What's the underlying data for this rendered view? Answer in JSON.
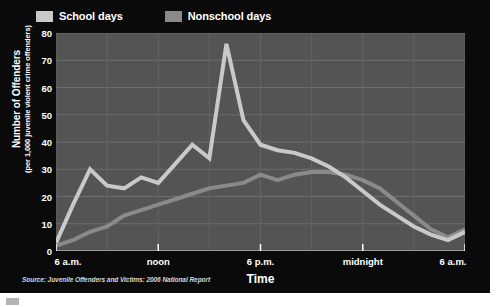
{
  "legend": {
    "items": [
      {
        "label": "School days",
        "color": "#c9c9c9",
        "name": "school-days"
      },
      {
        "label": "Nonschool days",
        "color": "#8a8a8a",
        "name": "nonschool-days"
      }
    ]
  },
  "axes": {
    "y_title_main": "Number of Offenders",
    "y_title_sub": "(per 1,000 juvenile violent crime offenders)",
    "x_title": "Time"
  },
  "source": "Source: Juvenile Offenders and Victims: 2006 National Report",
  "chart_data": {
    "type": "line",
    "title": "",
    "xlabel": "Time",
    "ylabel": "Number of Offenders",
    "ylabel_sub": "(per 1,000 juvenile violent crime offenders)",
    "ylim": [
      0,
      80
    ],
    "yticks": [
      0,
      10,
      20,
      30,
      40,
      50,
      60,
      70,
      80
    ],
    "grid": true,
    "legend_position": "top-left",
    "plot_bg": "#545454",
    "panel_bg": "#0a0a0a",
    "x": [
      6,
      7,
      8,
      9,
      10,
      11,
      12,
      13,
      14,
      15,
      16,
      17,
      18,
      19,
      20,
      21,
      22,
      23,
      24,
      25,
      26,
      27,
      28,
      29,
      30
    ],
    "xticks": [
      {
        "value": 6,
        "label": "6 a.m."
      },
      {
        "value": 12,
        "label": "noon"
      },
      {
        "value": 18,
        "label": "6 p.m."
      },
      {
        "value": 24,
        "label": "midnight"
      },
      {
        "value": 30,
        "label": "6 a.m."
      }
    ],
    "xtick_hours": [
      "6 a.m.",
      "noon",
      "6 p.m.",
      "midnight",
      "6 a.m."
    ],
    "series": [
      {
        "name": "School days",
        "color": "#c9c9c9",
        "values": [
          3,
          17,
          30,
          24,
          23,
          27,
          25,
          32,
          39,
          34,
          76,
          48,
          39,
          37,
          36,
          34,
          31,
          27,
          22,
          17,
          13,
          9,
          6,
          4,
          7
        ]
      },
      {
        "name": "Nonschool days",
        "color": "#8a8a8a",
        "values": [
          2,
          4,
          7,
          9,
          13,
          15,
          17,
          19,
          21,
          23,
          24,
          25,
          28,
          26,
          28,
          29,
          29,
          28,
          26,
          23,
          18,
          13,
          8,
          5,
          8
        ]
      }
    ]
  }
}
